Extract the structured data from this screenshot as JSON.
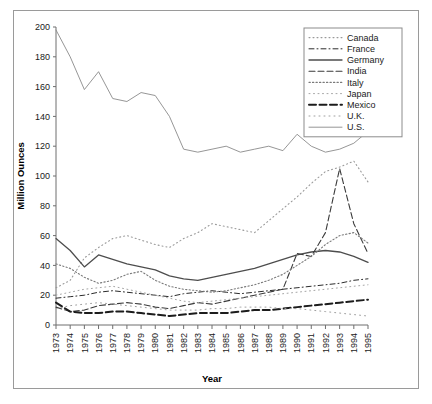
{
  "chart_data": {
    "type": "line",
    "title": "",
    "xlabel": "Year",
    "ylabel": "Million Ounces",
    "xlim": [
      1973,
      1995
    ],
    "ylim": [
      0,
      200
    ],
    "ytick_step": 20,
    "grid": false,
    "legend_position": "top-right",
    "x": [
      1973,
      1974,
      1975,
      1976,
      1977,
      1978,
      1979,
      1980,
      1981,
      1982,
      1983,
      1984,
      1985,
      1986,
      1987,
      1988,
      1989,
      1990,
      1991,
      1992,
      1993,
      1994,
      1995
    ],
    "yticks": [
      0,
      20,
      40,
      60,
      80,
      100,
      120,
      140,
      160,
      180,
      200
    ],
    "xticklabels": [
      "1973",
      "1974",
      "1975",
      "1976",
      "1977",
      "1978",
      "1979",
      "1980",
      "1981",
      "1982",
      "1983",
      "1984",
      "1985",
      "1986",
      "1987",
      "1988",
      "1989",
      "1990",
      "1991",
      "1992",
      "1993",
      "1994",
      "1995"
    ],
    "series": [
      {
        "name": "Canada",
        "style": "fine-dotted",
        "color": "#9a9a9a",
        "values": [
          25,
          30,
          45,
          52,
          58,
          60,
          57,
          54,
          52,
          58,
          62,
          68,
          66,
          64,
          62,
          70,
          78,
          86,
          95,
          103,
          106,
          110,
          96
        ]
      },
      {
        "name": "France",
        "style": "dash-dot",
        "color": "#2b2b2b",
        "values": [
          18,
          19,
          20,
          22,
          23,
          22,
          21,
          20,
          19,
          21,
          22,
          23,
          22,
          21,
          22,
          23,
          24,
          25,
          26,
          27,
          28,
          30,
          31
        ]
      },
      {
        "name": "Germany",
        "style": "solid",
        "color": "#4d4d4d",
        "values": [
          58,
          50,
          39,
          47,
          44,
          41,
          39,
          37,
          33,
          31,
          30,
          32,
          34,
          36,
          38,
          41,
          44,
          47,
          49,
          50,
          49,
          46,
          42
        ]
      },
      {
        "name": "India",
        "style": "dashed",
        "color": "#3a3a3a",
        "values": [
          12,
          9,
          10,
          13,
          14,
          15,
          14,
          12,
          11,
          13,
          15,
          14,
          16,
          18,
          20,
          22,
          24,
          48,
          46,
          62,
          105,
          68,
          48
        ]
      },
      {
        "name": "Italy",
        "style": "dotted",
        "color": "#7a7a7a",
        "values": [
          41,
          38,
          32,
          28,
          30,
          34,
          36,
          30,
          26,
          24,
          23,
          22,
          23,
          25,
          27,
          30,
          34,
          40,
          46,
          54,
          60,
          62,
          55
        ]
      },
      {
        "name": "Japan",
        "style": "fine-dotted2",
        "color": "#a5a5a5",
        "values": [
          20,
          22,
          24,
          25,
          26,
          24,
          22,
          20,
          18,
          16,
          15,
          16,
          17,
          18,
          19,
          20,
          21,
          22,
          23,
          24,
          25,
          26,
          27
        ]
      },
      {
        "name": "Mexico",
        "style": "bold-dashed",
        "color": "#1c1c1c",
        "values": [
          15,
          9,
          8,
          8,
          9,
          9,
          8,
          7,
          6,
          7,
          8,
          8,
          8,
          9,
          10,
          10,
          11,
          12,
          13,
          14,
          15,
          16,
          17
        ]
      },
      {
        "name": "U.K.",
        "style": "sparse-dotted",
        "color": "#9f9f9f",
        "values": [
          11,
          13,
          14,
          15,
          14,
          13,
          12,
          11,
          10,
          10,
          10,
          11,
          11,
          12,
          12,
          12,
          11,
          11,
          10,
          9,
          8,
          7,
          6
        ]
      },
      {
        "name": "U.S.",
        "style": "thin-solid",
        "color": "#8a8a8a",
        "values": [
          198,
          180,
          158,
          170,
          152,
          150,
          156,
          154,
          140,
          118,
          116,
          118,
          120,
          116,
          118,
          120,
          117,
          128,
          120,
          116,
          118,
          122,
          130
        ]
      }
    ]
  },
  "legend": {
    "entries": [
      {
        "label": "Canada"
      },
      {
        "label": "France"
      },
      {
        "label": "Germany"
      },
      {
        "label": "India"
      },
      {
        "label": "Italy"
      },
      {
        "label": "Japan"
      },
      {
        "label": "Mexico"
      },
      {
        "label": "U.K."
      },
      {
        "label": "U.S."
      }
    ]
  }
}
